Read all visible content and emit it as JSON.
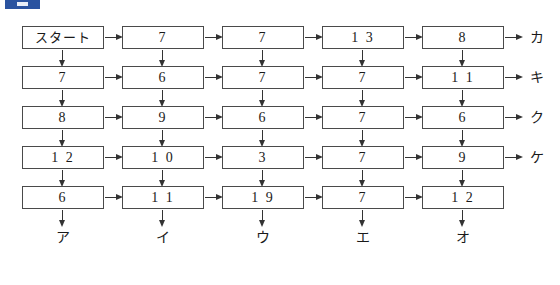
{
  "badge": {
    "color": "#2a53a0"
  },
  "header": {
    "ghost_text": ""
  },
  "diagram": {
    "type": "flow-grid",
    "columns": 5,
    "rows": 5,
    "start_label": "スタート",
    "cells": [
      [
        "スタート",
        "7",
        "7",
        "1 3",
        "8"
      ],
      [
        "7",
        "6",
        "7",
        "7",
        "1 1"
      ],
      [
        "8",
        "9",
        "6",
        "7",
        "6"
      ],
      [
        "1 2",
        "1 0",
        "3",
        "7",
        "9"
      ],
      [
        "6",
        "1 1",
        "1 9",
        "7",
        "1 2"
      ]
    ],
    "right_labels": [
      "カ",
      "キ",
      "ク",
      "ケ",
      ""
    ],
    "bottom_labels": [
      "ア",
      "イ",
      "ウ",
      "エ",
      "オ"
    ],
    "arrow_right_icon": "arrow-right-icon",
    "arrow_down_icon": "arrow-down-icon"
  },
  "colors": {
    "box_border": "#4a4a4a",
    "arrow": "#333333",
    "badge_blue": "#2a53a0",
    "text": "#1a1a1a"
  }
}
